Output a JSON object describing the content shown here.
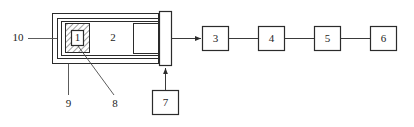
{
  "diagram": {
    "background_color": "#ffffff",
    "line_color": "#2b2b2b",
    "components": {
      "sample": {
        "label": "1",
        "name": "hatched-sample-block-inner"
      },
      "chamber_interior": {
        "label": "2",
        "name": "chamber-interior-region"
      },
      "unit_3": {
        "label": "3"
      },
      "unit_4": {
        "label": "4"
      },
      "unit_5": {
        "label": "5"
      },
      "unit_6": {
        "label": "6"
      },
      "unit_7": {
        "label": "7"
      },
      "callout_8": {
        "label": "8"
      },
      "callout_9": {
        "label": "9"
      },
      "callout_10": {
        "label": "10"
      }
    },
    "chain_labels": [
      "3",
      "4",
      "5",
      "6"
    ]
  }
}
